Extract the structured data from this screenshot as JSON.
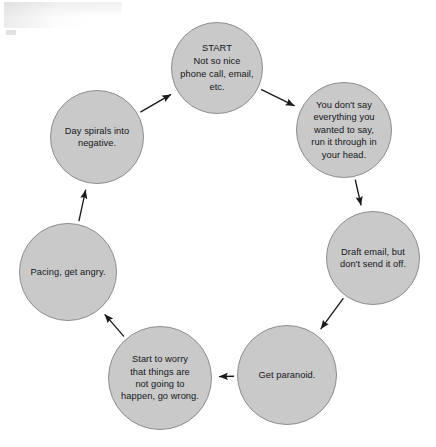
{
  "diagram": {
    "type": "cycle-flowchart",
    "direction": "clockwise",
    "node_fill_color": "#c9c9c9",
    "node_stroke_color": "#8d8d8d",
    "edge_color": "#1a1a1a",
    "background_color": "#ffffff",
    "nodes": [
      {
        "id": "start",
        "label": "START\nNot so nice\nphone call, email,\netc.",
        "cx": 217,
        "cy": 68,
        "r": 46
      },
      {
        "id": "hold-back",
        "label": "You don't say\neverything you\nwanted to say,\nrun it through in\nyour head.",
        "cx": 344,
        "cy": 130,
        "r": 48
      },
      {
        "id": "draft-email",
        "label": "Draft email, but\ndon't send it off.",
        "cx": 373,
        "cy": 258,
        "r": 47
      },
      {
        "id": "get-paranoid",
        "label": "Get paranoid.",
        "cx": 287,
        "cy": 375,
        "r": 50
      },
      {
        "id": "start-to-worry",
        "label": "Start to worry\nthat things are\nnot going to\nhappen, go wrong.",
        "cx": 160,
        "cy": 378,
        "r": 52
      },
      {
        "id": "pacing",
        "label": "Pacing, get angry.",
        "cx": 68,
        "cy": 272,
        "r": 49
      },
      {
        "id": "day-spirals",
        "label": "Day spirals into\nnegative.",
        "cx": 97,
        "cy": 137,
        "r": 47
      }
    ],
    "edges": [
      {
        "id": "edge-start-to-hold-back",
        "from": "start",
        "to": "hold-back"
      },
      {
        "id": "edge-hold-back-to-draft-email",
        "from": "hold-back",
        "to": "draft-email"
      },
      {
        "id": "edge-draft-email-to-paranoid",
        "from": "draft-email",
        "to": "get-paranoid"
      },
      {
        "id": "edge-paranoid-to-worry",
        "from": "get-paranoid",
        "to": "start-to-worry"
      },
      {
        "id": "edge-worry-to-pacing",
        "from": "start-to-worry",
        "to": "pacing"
      },
      {
        "id": "edge-pacing-to-day-spirals",
        "from": "pacing",
        "to": "day-spirals"
      },
      {
        "id": "edge-day-spirals-to-start",
        "from": "day-spirals",
        "to": "start"
      }
    ]
  }
}
